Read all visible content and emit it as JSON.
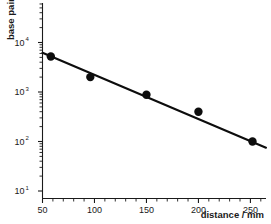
{
  "chart_data": {
    "type": "scatter",
    "title": "",
    "xlabel": "distance / mm",
    "ylabel": "base pairs",
    "xscale": "linear",
    "yscale": "log",
    "xlim": [
      50,
      265
    ],
    "ylim": [
      10,
      30000
    ],
    "grid": false,
    "legend": null,
    "xticks": [
      50,
      100,
      150,
      200,
      250
    ],
    "xtick_labels": [
      "50",
      "100",
      "150",
      "200",
      "250"
    ],
    "xminor_step": 10,
    "yticks": [
      10,
      100,
      1000,
      10000
    ],
    "ytick_labels": [
      "10^1",
      "10^2",
      "10^3",
      "10^4"
    ],
    "ytick_mantissas": [
      "10",
      "10",
      "10",
      "10"
    ],
    "ytick_exponents": [
      "1",
      "2",
      "3",
      "4"
    ],
    "series": [
      {
        "name": "measured",
        "marker": "filled-circle",
        "color": "#0d0d0d",
        "x": [
          58,
          96,
          150,
          200,
          252
        ],
        "y": [
          5200,
          2000,
          880,
          400,
          100
        ]
      },
      {
        "name": "fit",
        "type": "line",
        "color": "#0d0d0d",
        "x": [
          50,
          265
        ],
        "y": [
          6200,
          75
        ]
      }
    ]
  },
  "axes": {
    "y_label": "base pairs",
    "x_label": "distance / mm"
  }
}
